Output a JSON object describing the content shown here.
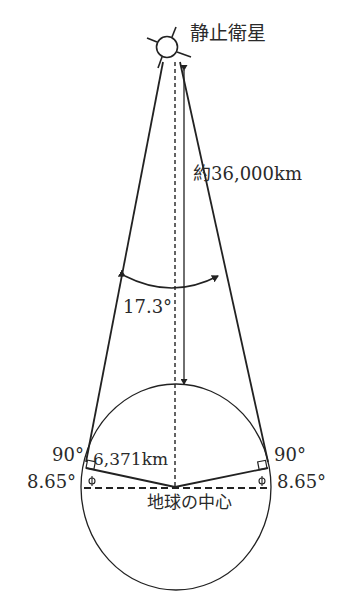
{
  "diagram": {
    "title_label": "静止衛星",
    "distance_label": "約36,000km",
    "angle_label": "17.3°",
    "radius_label": "6,371km",
    "right_angle_left": "90°",
    "right_angle_right": "90°",
    "half_angle_left": "8.65°",
    "half_angle_right": "8.65°",
    "center_label": "地球の中心",
    "colors": {
      "line": "#222222",
      "background": "#ffffff"
    }
  }
}
